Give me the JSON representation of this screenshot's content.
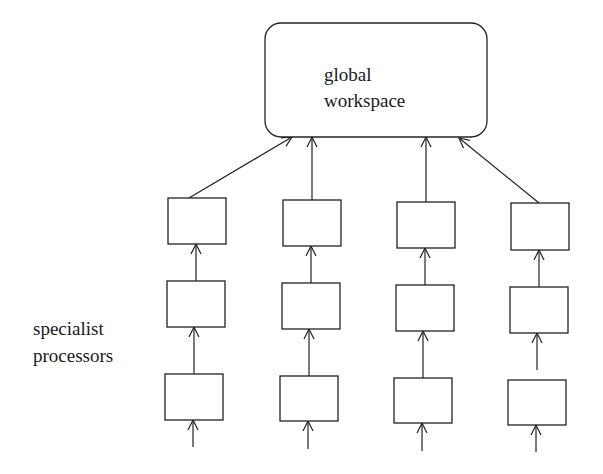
{
  "diagram": {
    "type": "architecture",
    "title": "",
    "workspace": {
      "label_line1": "global",
      "label_line2": "workspace",
      "x": 265,
      "y": 23,
      "w": 222,
      "h": 114,
      "r": 16
    },
    "side_label": {
      "line1": "specialist",
      "line2": "processors"
    },
    "columns": [
      {
        "id": "col-1",
        "boxes": [
          {
            "x": 168,
            "y": 198,
            "w": 58,
            "h": 46
          },
          {
            "x": 167,
            "y": 281,
            "w": 58,
            "h": 46
          },
          {
            "x": 165,
            "y": 374,
            "w": 58,
            "h": 46
          }
        ]
      },
      {
        "id": "col-2",
        "boxes": [
          {
            "x": 283,
            "y": 200,
            "w": 58,
            "h": 46
          },
          {
            "x": 282,
            "y": 283,
            "w": 58,
            "h": 46
          },
          {
            "x": 280,
            "y": 376,
            "w": 58,
            "h": 45
          }
        ]
      },
      {
        "id": "col-3",
        "boxes": [
          {
            "x": 397,
            "y": 202,
            "w": 58,
            "h": 46
          },
          {
            "x": 396,
            "y": 285,
            "w": 58,
            "h": 46
          },
          {
            "x": 394,
            "y": 378,
            "w": 58,
            "h": 45
          }
        ]
      },
      {
        "id": "col-4",
        "boxes": [
          {
            "x": 511,
            "y": 203,
            "w": 58,
            "h": 47
          },
          {
            "x": 510,
            "y": 287,
            "w": 58,
            "h": 46
          },
          {
            "x": 508,
            "y": 380,
            "w": 58,
            "h": 45
          }
        ]
      }
    ],
    "edges": [
      {
        "from": "col-1.top",
        "to": "workspace",
        "x1": 189,
        "y1": 198,
        "x2": 292,
        "y2": 137
      },
      {
        "from": "col-2.top",
        "to": "workspace",
        "x1": 312,
        "y1": 200,
        "x2": 312,
        "y2": 137
      },
      {
        "from": "col-3.top",
        "to": "workspace",
        "x1": 426,
        "y1": 202,
        "x2": 426,
        "y2": 137
      },
      {
        "from": "col-4.top",
        "to": "workspace",
        "x1": 539,
        "y1": 203,
        "x2": 459,
        "y2": 138
      },
      {
        "from": "col-1.mid",
        "to": "col-1.top",
        "x1": 196,
        "y1": 281,
        "x2": 196,
        "y2": 244
      },
      {
        "from": "col-1.bot",
        "to": "col-1.mid",
        "x1": 194,
        "y1": 374,
        "x2": 194,
        "y2": 327
      },
      {
        "from": "input",
        "to": "col-1.bot",
        "x1": 193,
        "y1": 447,
        "x2": 193,
        "y2": 420
      },
      {
        "from": "col-2.mid",
        "to": "col-2.top",
        "x1": 311,
        "y1": 283,
        "x2": 311,
        "y2": 246
      },
      {
        "from": "col-2.bot",
        "to": "col-2.mid",
        "x1": 309,
        "y1": 376,
        "x2": 309,
        "y2": 329
      },
      {
        "from": "input",
        "to": "col-2.bot",
        "x1": 308,
        "y1": 449,
        "x2": 308,
        "y2": 421
      },
      {
        "from": "col-3.mid",
        "to": "col-3.top",
        "x1": 425,
        "y1": 285,
        "x2": 425,
        "y2": 248
      },
      {
        "from": "col-3.bot",
        "to": "col-3.mid",
        "x1": 423,
        "y1": 378,
        "x2": 423,
        "y2": 331
      },
      {
        "from": "input",
        "to": "col-3.bot",
        "x1": 422,
        "y1": 451,
        "x2": 422,
        "y2": 423
      },
      {
        "from": "col-4.mid",
        "to": "col-4.top",
        "x1": 539,
        "y1": 287,
        "x2": 539,
        "y2": 250
      },
      {
        "from": "col-4.bot",
        "to": "col-4.mid",
        "x1": 537,
        "y1": 370,
        "x2": 537,
        "y2": 333
      },
      {
        "from": "input",
        "to": "col-4.bot",
        "x1": 536,
        "y1": 452,
        "x2": 536,
        "y2": 425
      }
    ]
  }
}
